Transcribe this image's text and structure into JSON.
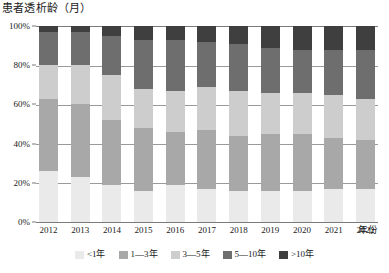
{
  "chart_data": {
    "type": "bar",
    "subtype": "100% stacked column",
    "title": "患者透析龄（月）",
    "xlabel": "年份",
    "ylabel": "",
    "ylim": [
      0,
      100
    ],
    "ytick_labels": [
      "0%",
      "20%",
      "40%",
      "60%",
      "80%",
      "100%"
    ],
    "ytick_values": [
      0,
      20,
      40,
      60,
      80,
      100
    ],
    "grid": true,
    "grid_axis": "y",
    "legend_position": "bottom",
    "categories": [
      "2012",
      "2013",
      "2014",
      "2015",
      "2016",
      "2017",
      "2018",
      "2019",
      "2020",
      "2021",
      "2022"
    ],
    "series": [
      {
        "name": "<1年",
        "color": "#eaeaea",
        "values": [
          26,
          23,
          19,
          16,
          19,
          17,
          16,
          16,
          16,
          17,
          17
        ]
      },
      {
        "name": "1—3年",
        "color": "#a8a8a8",
        "values": [
          37,
          37,
          33,
          32,
          27,
          30,
          28,
          29,
          29,
          26,
          25
        ]
      },
      {
        "name": "3—5年",
        "color": "#cdcdcd",
        "values": [
          17,
          20,
          23,
          20,
          21,
          22,
          23,
          21,
          21,
          22,
          21
        ]
      },
      {
        "name": "5—10年",
        "color": "#6e6e6e",
        "values": [
          17,
          17,
          20,
          25,
          26,
          23,
          24,
          23,
          22,
          23,
          25
        ]
      },
      {
        "name": ">10年",
        "color": "#3f3f3f",
        "values": [
          3,
          3,
          5,
          7,
          7,
          8,
          9,
          11,
          12,
          12,
          12
        ]
      }
    ]
  },
  "axis": {
    "x_title": "年份"
  },
  "colors": {
    "axis_line": "#7a7a7a",
    "gridline": "#9a9a9a",
    "text": "#1a1a1a",
    "background": "#ffffff"
  }
}
